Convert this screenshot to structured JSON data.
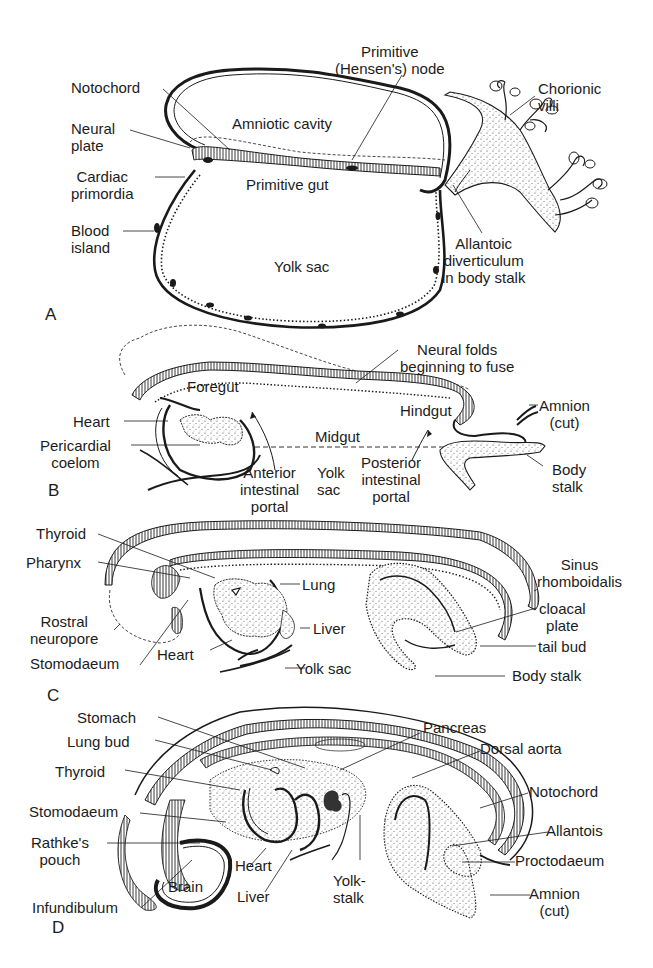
{
  "figure": {
    "panels": [
      {
        "id": "A",
        "letter": "A",
        "labels": {
          "notochord": "Notochord",
          "primitive_node": "Primitive\n(Hensen's) node",
          "chorionic_villi": "Chorionic\nvilli",
          "neural_plate": "Neural\nplate",
          "amniotic_cavity": "Amniotic cavity",
          "cardiac_primordia": "Cardiac\nprimordia",
          "primitive_gut": "Primitive gut",
          "blood_island": "Blood\nisland",
          "yolk_sac": "Yolk sac",
          "allantoic_diverticulum": "Allantoic\ndiverticulum\nin body stalk"
        }
      },
      {
        "id": "B",
        "letter": "B",
        "labels": {
          "neural_folds": "Neural folds\nbeginning to fuse",
          "foregut": "Foregut",
          "heart": "Heart",
          "hindgut": "Hindgut",
          "amnion_cut": "Amnion\n(cut)",
          "midgut": "Midgut",
          "pericardial_coelom": "Pericardial\ncoelom",
          "anterior_portal": "Anterior\nintestinal\nportal",
          "yolk_sac": "Yolk\nsac",
          "posterior_portal": "Posterior\nintestinal\nportal",
          "body_stalk": "Body\nstalk"
        }
      },
      {
        "id": "C",
        "letter": "C",
        "labels": {
          "thyroid": "Thyroid",
          "pharynx": "Pharynx",
          "lung": "Lung",
          "sinus_rhomboidalis": "Sinus\nrhomboidalis",
          "rostral_neuropore": "Rostral\nneuropore",
          "liver": "Liver",
          "cloacal_plate": "cloacal\nplate",
          "stomodaeum": "Stomodaeum",
          "heart": "Heart",
          "tail_bud": "tail bud",
          "yolk_sac": "Yolk sac",
          "body_stalk": "Body stalk"
        }
      },
      {
        "id": "D",
        "letter": "D",
        "labels": {
          "stomach": "Stomach",
          "pancreas": "Pancreas",
          "lung_bud": "Lung bud",
          "dorsal_aorta": "Dorsal aorta",
          "thyroid": "Thyroid",
          "notochord": "Notochord",
          "stomodaeum": "Stomodaeum",
          "allantois": "Allantois",
          "rathkes_pouch": "Rathke's\npouch",
          "heart": "Heart",
          "proctodaeum": "Proctodaeum",
          "brain": "Brain",
          "liver": "Liver",
          "yolk_stalk": "Yolk-\nstalk",
          "amnion_cut": "Amnion\n(cut)",
          "infundibulum": "Infundibulum"
        }
      }
    ],
    "colors": {
      "ink": "#1a1a1a",
      "background": "#ffffff"
    }
  }
}
